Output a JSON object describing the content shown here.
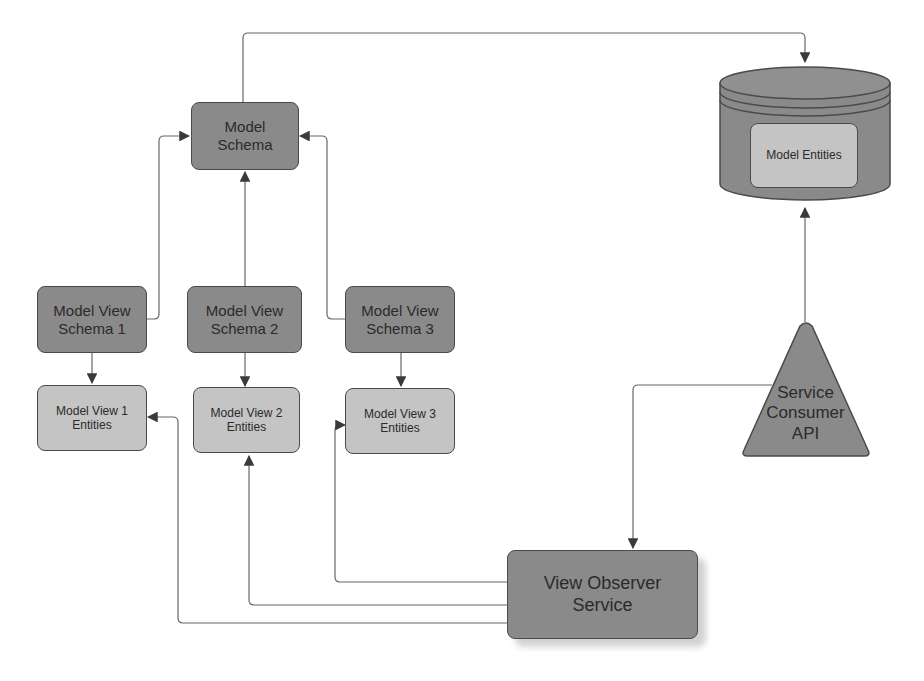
{
  "diagram": {
    "nodes": {
      "model_schema": "Model\nSchema",
      "model_entities": "Model Entities",
      "mvs1": "Model View\nSchema 1",
      "mvs2": "Model View\nSchema 2",
      "mvs3": "Model View\nSchema 3",
      "mve1": "Model View 1\nEntities",
      "mve2": "Model View 2\nEntities",
      "mve3": "Model View 3\nEntities",
      "service_consumer_api": "Service\nConsumer\nAPI",
      "view_observer_service": "View Observer\nService"
    },
    "edges": [
      {
        "from": "Model Schema",
        "to": "Model Entities (database)"
      },
      {
        "from": "Model View Schema 1",
        "to": "Model Schema"
      },
      {
        "from": "Model View Schema 2",
        "to": "Model Schema"
      },
      {
        "from": "Model View Schema 3",
        "to": "Model Schema"
      },
      {
        "from": "Model View Schema 1",
        "to": "Model View 1 Entities"
      },
      {
        "from": "Model View Schema 2",
        "to": "Model View 2 Entities"
      },
      {
        "from": "Model View Schema 3",
        "to": "Model View 3 Entities"
      },
      {
        "from": "Service Consumer API",
        "to": "Model Entities (database)"
      },
      {
        "from": "Service Consumer API",
        "to": "View Observer Service"
      },
      {
        "from": "View Observer Service",
        "to": "Model View 1 Entities"
      },
      {
        "from": "View Observer Service",
        "to": "Model View 2 Entities"
      },
      {
        "from": "View Observer Service",
        "to": "Model View 3 Entities"
      }
    ],
    "colors": {
      "dark_node": "#8a8a8a",
      "light_node": "#c4c4c4",
      "line": "#555555"
    }
  }
}
